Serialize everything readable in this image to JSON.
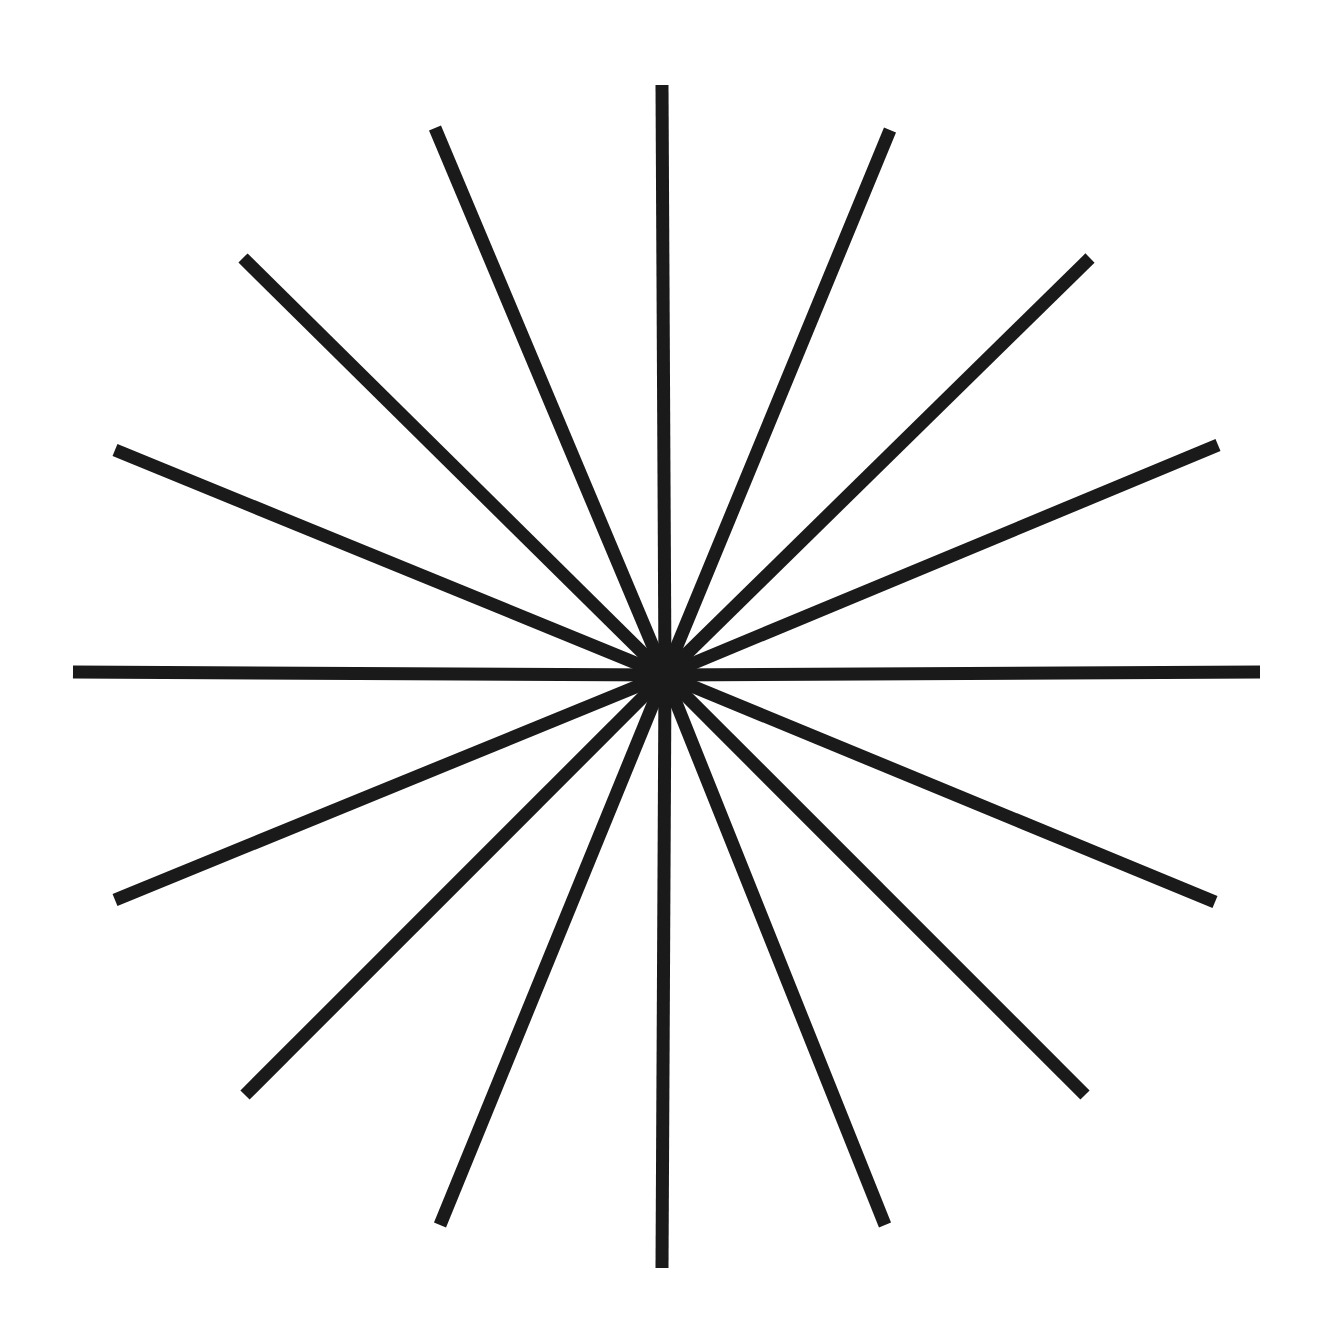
{
  "figure": {
    "type": "line-art-figure",
    "background_color": "#ffffff",
    "stroke_color": "#1a1a1a",
    "canvas": {
      "width": 1337,
      "height": 1333
    }
  },
  "chart_data": {
    "type": "scatter",
    "subtitle": "",
    "xlabel": "",
    "ylabel": "",
    "grid": false,
    "legend": false,
    "xlim": [
      0,
      1337
    ],
    "ylim": [
      0,
      1333
    ],
    "center": {
      "x": 665,
      "y": 675
    },
    "ray_count": 16,
    "angle_step_degrees": 22.5,
    "stroke_width": 13,
    "stroke_color": "#1a1a1a",
    "background_color": "#ffffff",
    "rays": [
      {
        "index": 0,
        "angle_degrees": 90,
        "label": "up",
        "end": {
          "x": 662,
          "y": 85
        },
        "length": 590
      },
      {
        "index": 1,
        "angle_degrees": 67.5,
        "label": "up-up-right",
        "end": {
          "x": 890,
          "y": 130
        },
        "length": 595
      },
      {
        "index": 2,
        "angle_degrees": 45,
        "label": "up-right",
        "end": {
          "x": 1090,
          "y": 258
        },
        "length": 595
      },
      {
        "index": 3,
        "angle_degrees": 22.5,
        "label": "right-up-right",
        "end": {
          "x": 1218,
          "y": 445
        },
        "length": 597
      },
      {
        "index": 4,
        "angle_degrees": 0,
        "label": "right",
        "end": {
          "x": 1260,
          "y": 672
        },
        "length": 595
      },
      {
        "index": 5,
        "angle_degrees": 337.5,
        "label": "right-down-right",
        "end": {
          "x": 1215,
          "y": 902
        },
        "length": 596
      },
      {
        "index": 6,
        "angle_degrees": 315,
        "label": "down-right",
        "end": {
          "x": 1085,
          "y": 1095
        },
        "length": 594
      },
      {
        "index": 7,
        "angle_degrees": 292.5,
        "label": "down-down-right",
        "end": {
          "x": 885,
          "y": 1225
        },
        "length": 594
      },
      {
        "index": 8,
        "angle_degrees": 270,
        "label": "down",
        "end": {
          "x": 662,
          "y": 1268
        },
        "length": 593
      },
      {
        "index": 9,
        "angle_degrees": 247.5,
        "label": "down-down-left",
        "end": {
          "x": 440,
          "y": 1225
        },
        "length": 594
      },
      {
        "index": 10,
        "angle_degrees": 225,
        "label": "down-left",
        "end": {
          "x": 245,
          "y": 1095
        },
        "length": 594
      },
      {
        "index": 11,
        "angle_degrees": 202.5,
        "label": "left-down-left",
        "end": {
          "x": 115,
          "y": 900
        },
        "length": 595
      },
      {
        "index": 12,
        "angle_degrees": 180,
        "label": "left",
        "end": {
          "x": 73,
          "y": 672
        },
        "length": 592
      },
      {
        "index": 13,
        "angle_degrees": 157.5,
        "label": "left-up-left",
        "end": {
          "x": 115,
          "y": 450
        },
        "length": 596
      },
      {
        "index": 14,
        "angle_degrees": 135,
        "label": "up-left",
        "end": {
          "x": 243,
          "y": 258
        },
        "length": 595
      },
      {
        "index": 15,
        "angle_degrees": 112.5,
        "label": "up-up-left",
        "end": {
          "x": 435,
          "y": 128
        },
        "length": 594
      }
    ]
  }
}
